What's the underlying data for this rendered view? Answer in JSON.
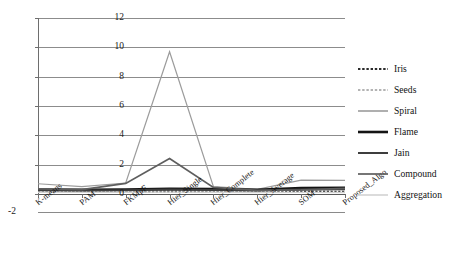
{
  "chart_data": {
    "type": "line",
    "title": "",
    "xlabel": "",
    "ylabel": "",
    "ylim": [
      -2,
      12
    ],
    "yticks": [
      0,
      2,
      4,
      6,
      8,
      10,
      12
    ],
    "ytick_labels": [
      "0",
      "2",
      "4",
      "6",
      "8",
      "10",
      "12"
    ],
    "extra_axis_label": "-2",
    "grid": true,
    "legend_position": "right",
    "categories": [
      "K-means",
      "PAM",
      "FKMpF",
      "Hier_Single",
      "Hier_Complete",
      "Hier_Average",
      "SOM",
      "Proposed_Algo"
    ],
    "series": [
      {
        "name": "Iris",
        "color": "#2b2b2b",
        "style": "dotted",
        "width": 2.0,
        "values": [
          0.18,
          0.16,
          0.15,
          0.17,
          0.16,
          0.14,
          0.15,
          0.13
        ]
      },
      {
        "name": "Seeds",
        "color": "#9a9a9a",
        "style": "dotted",
        "width": 1.6,
        "values": [
          0.22,
          0.2,
          0.21,
          0.24,
          0.22,
          0.2,
          0.25,
          0.3
        ]
      },
      {
        "name": "Spiral",
        "color": "#9c9c9c",
        "style": "solid",
        "width": 1.2,
        "values": [
          0.7,
          0.5,
          0.75,
          9.7,
          0.5,
          0.32,
          0.95,
          0.93
        ]
      },
      {
        "name": "Flame",
        "color": "#141414",
        "style": "solid",
        "width": 2.6,
        "values": [
          0.3,
          0.28,
          0.3,
          0.35,
          0.33,
          0.28,
          0.4,
          0.42
        ]
      },
      {
        "name": "Jain",
        "color": "#3d3d3d",
        "style": "solid",
        "width": 2.0,
        "values": [
          0.25,
          0.24,
          0.26,
          0.3,
          0.28,
          0.24,
          0.3,
          0.32
        ]
      },
      {
        "name": "Compound",
        "color": "#5e5e5e",
        "style": "solid",
        "width": 1.7,
        "values": [
          0.35,
          0.3,
          0.72,
          2.42,
          0.45,
          0.25,
          0.28,
          0.38
        ]
      },
      {
        "name": "Aggregation",
        "color": "#d2d2d2",
        "style": "solid",
        "width": 1.4,
        "values": [
          0.12,
          0.11,
          0.12,
          0.13,
          0.12,
          0.1,
          0.11,
          0.1
        ]
      }
    ]
  },
  "legend": {
    "items": [
      {
        "label": "Iris"
      },
      {
        "label": "Seeds"
      },
      {
        "label": "Spiral"
      },
      {
        "label": "Flame"
      },
      {
        "label": "Jain"
      },
      {
        "label": "Compound"
      },
      {
        "label": "Aggregation"
      }
    ]
  }
}
